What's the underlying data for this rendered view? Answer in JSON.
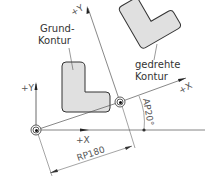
{
  "labels": {
    "base_contour": [
      "Grund-",
      "Kontur"
    ],
    "rotated_contour": [
      "gedrehte",
      "Kontur"
    ],
    "base_x": "+X",
    "base_y": "+Y",
    "rotated_x": "+X",
    "rotated_y": "+Y",
    "radius_dim": "RP180",
    "angle_dim": "AP20°"
  },
  "colors": {
    "contour_fill": "#e0e0e0",
    "contour_stroke": "#333333",
    "line": "#555555"
  }
}
